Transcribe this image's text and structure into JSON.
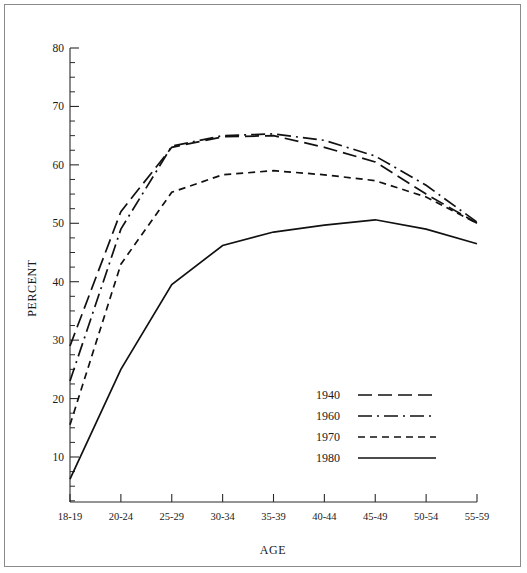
{
  "figure": {
    "background": "#ffffff",
    "frame_color": "#8a8a8a",
    "line_color": "#111111"
  },
  "axis": {
    "ylabel": "PERCENT",
    "xlabel": "AGE",
    "ytick_labels": [
      "80",
      "70",
      "60",
      "50",
      "40",
      "30",
      "20",
      "10"
    ],
    "xtick_labels": [
      "18-19",
      "20-24",
      "25-29",
      "30-34",
      "35-39",
      "40-44",
      "45-49",
      "50-54",
      "55-59"
    ]
  },
  "legend": {
    "entries": [
      {
        "label": "1940",
        "dash": "14,6"
      },
      {
        "label": "1960",
        "dash": "14,5,2,5"
      },
      {
        "label": "1970",
        "dash": "7,5"
      },
      {
        "label": "1980",
        "dash": "none"
      }
    ]
  },
  "chart_data": {
    "type": "line",
    "title": "",
    "xlabel": "AGE",
    "ylabel": "PERCENT",
    "ylim": [
      0,
      80
    ],
    "ytick_major": [
      10,
      20,
      30,
      40,
      50,
      60,
      70,
      80
    ],
    "ytick_minor_step": 2.5,
    "grid": false,
    "legend_position": "center-right-inside",
    "categories": [
      "18-19",
      "20-24",
      "25-29",
      "30-34",
      "35-39",
      "40-44",
      "45-49",
      "50-54",
      "55-59"
    ],
    "series": [
      {
        "name": "1940",
        "dash": "14,6",
        "values": [
          29.0,
          52.0,
          63.0,
          64.8,
          65.0,
          63.0,
          60.5,
          55.0,
          50.0
        ]
      },
      {
        "name": "1960",
        "dash": "14,5,2,5",
        "values": [
          23.0,
          49.0,
          63.2,
          65.0,
          65.3,
          64.2,
          61.5,
          56.5,
          50.2
        ]
      },
      {
        "name": "1970",
        "dash": "7,5",
        "values": [
          15.5,
          43.0,
          55.3,
          58.3,
          59.0,
          58.3,
          57.3,
          54.5,
          50.0
        ]
      },
      {
        "name": "1980",
        "dash": "none",
        "values": [
          6.2,
          25.0,
          39.5,
          46.2,
          48.5,
          49.7,
          50.6,
          49.0,
          46.5
        ]
      }
    ]
  }
}
